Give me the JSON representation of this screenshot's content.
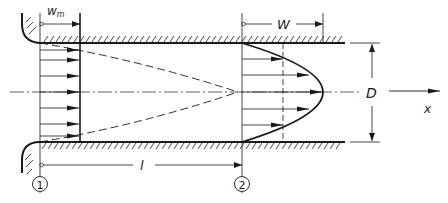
{
  "diagram": {
    "type": "pipe-entrance-flow-development",
    "labels": {
      "mean_velocity": "w",
      "mean_velocity_sub": "m",
      "max_velocity": "W",
      "diameter": "D",
      "axis": "x",
      "entrance_length": "l",
      "station_1": "1",
      "station_2": "2"
    },
    "colors": {
      "line": "#1a1a1a",
      "background": "#ffffff"
    },
    "elements": {
      "inlet": "rounded bell-mouth inlet with hatched wall",
      "profile_1": "uniform velocity profile (7 arrows) at station 1",
      "profile_2": "parabolic fully developed profile (5 arrows) at station 2",
      "boundary_layer": "dashed boundary-layer lines converging on centerline",
      "centerline": "dash-dot axis"
    }
  }
}
